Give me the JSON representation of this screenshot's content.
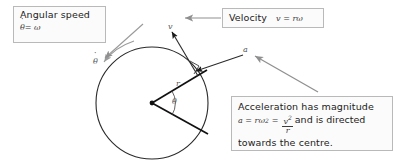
{
  "figure": {
    "background_color": "#ffffff",
    "stroke_color": "#1a1a1a",
    "leader_color": "#8a8a8a",
    "box_border_color": "#b9b9b9",
    "box_fill_color": "#fbfbfb"
  },
  "callouts": {
    "angular_speed": {
      "label": "Angular speed",
      "formula_symbol": "θ",
      "formula_rest": "= ω"
    },
    "velocity": {
      "label": "Velocity",
      "formula": "v = rω"
    },
    "acceleration": {
      "line1": "Acceleration has magnitude",
      "formula_lead": "a = rω",
      "formula_exp1": "2",
      "formula_eq": "=",
      "fraction_numerator": "v",
      "fraction_numerator_exp": "2",
      "fraction_denominator": "r",
      "line2_tail": "and is directed",
      "line3": "towards the centre."
    }
  },
  "diagram_labels": {
    "velocity_vector": "v",
    "acceleration_vector": "a",
    "radius": "r",
    "angle": "θ",
    "angular_rate_symbol": "θ"
  },
  "geometry": {
    "circle_center_x": 152,
    "circle_center_y": 103,
    "circle_radius": 56,
    "radius_upper_end_x": 200,
    "radius_upper_end_y": 74,
    "radius_lower_end_x": 207,
    "radius_lower_end_y": 133,
    "velocity_tip_x": 171,
    "velocity_tip_y": 30,
    "acceleration_tip_x": 193,
    "acceleration_tip_y": 70
  }
}
